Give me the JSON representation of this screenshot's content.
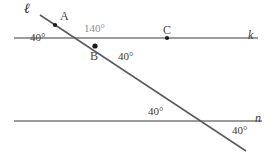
{
  "figure": {
    "kind": "geometry-diagram",
    "stroke_color": "#7a7a7a",
    "transversal_color": "#5a5a5a",
    "point_color": "#1a1a1a",
    "background": "#ffffff"
  },
  "lines": [
    {
      "id": "k",
      "label": "k",
      "label_x": 248,
      "label_y": 28,
      "x1": 14,
      "y1": 38,
      "x2": 258,
      "y2": 38
    },
    {
      "id": "n",
      "label": "n",
      "label_x": 255,
      "label_y": 112,
      "x1": 14,
      "y1": 121,
      "x2": 262,
      "y2": 121
    },
    {
      "id": "l",
      "label": "ℓ",
      "label_x": 24,
      "label_y": 3,
      "x1": 40,
      "y1": 15,
      "x2": 246,
      "y2": 151
    }
  ],
  "points": [
    {
      "id": "A",
      "label": "A",
      "cx": 55,
      "cy": 25,
      "label_x": 60,
      "label_y": 11
    },
    {
      "id": "B",
      "label": "B",
      "cx": 95,
      "cy": 46,
      "label_x": 90,
      "label_y": 50
    },
    {
      "id": "C",
      "label": "C",
      "cx": 167,
      "cy": 38,
      "label_x": 163,
      "label_y": 25
    }
  ],
  "angles": [
    {
      "id": "angle-upper-left",
      "value": "40",
      "unit": "°",
      "text": "40°",
      "x": 30,
      "y": 32,
      "style": "dark"
    },
    {
      "id": "angle-upper-right",
      "value": "140",
      "unit": "°",
      "text": "140°",
      "x": 84,
      "y": 24,
      "style": "gray"
    },
    {
      "id": "angle-below-b",
      "value": "40",
      "unit": "°",
      "text": "40°",
      "x": 118,
      "y": 51,
      "style": "dark"
    },
    {
      "id": "angle-lower-left",
      "value": "40",
      "unit": "°",
      "text": "40°",
      "x": 148,
      "y": 107,
      "style": "dark"
    },
    {
      "id": "angle-lower-right",
      "value": "40",
      "unit": "°",
      "text": "40°",
      "x": 232,
      "y": 126,
      "style": "dark"
    }
  ]
}
